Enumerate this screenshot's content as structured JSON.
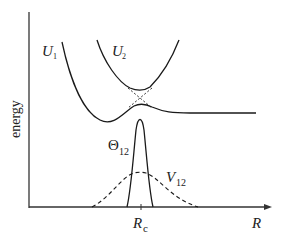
{
  "figure": {
    "type": "avoided-crossing potential energy diagram",
    "y_axis_label": "energy",
    "x_axis_label": "R",
    "crossing_point_label": "R",
    "crossing_point_subscript": "c",
    "curves": [
      {
        "name": "U",
        "subscript": "1",
        "style": "solid",
        "description": "diabatic/adiabatic lower potential curve"
      },
      {
        "name": "U",
        "subscript": "2",
        "style": "solid",
        "description": "upper potential curve"
      },
      {
        "name": "Θ",
        "subscript": "12",
        "style": "solid",
        "description": "sharp peak centered at R_c"
      },
      {
        "name": "V",
        "subscript": "12",
        "style": "dashed",
        "description": "broad coupling peak centered at R_c"
      }
    ],
    "colors": {
      "line": "#1a1a1a",
      "background": "#ffffff"
    }
  }
}
